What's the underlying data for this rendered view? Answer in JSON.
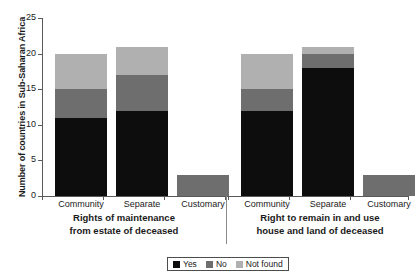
{
  "chart_data": {
    "type": "bar",
    "subtype": "stacked-bar-grouped",
    "title": "",
    "xlabel": "",
    "ylabel": "Number of countries in Sub-Saharan Africa",
    "ylim": [
      0,
      25
    ],
    "yticks": [
      0,
      5,
      10,
      15,
      20,
      25
    ],
    "ytick_labels": [
      "0",
      "5",
      "10",
      "15",
      "20",
      "25"
    ],
    "grid": false,
    "legend_position": "bottom-center",
    "categories": [
      "Community",
      "Separate",
      "Customary",
      "Community",
      "Separate",
      "Customary"
    ],
    "groups": [
      {
        "label_line1": "Rights of maintenance",
        "label_line2": "from estate of deceased",
        "categories": [
          "Community",
          "Separate",
          "Customary"
        ]
      },
      {
        "label_line1": "Right to remain in and use",
        "label_line2": "house and land of deceased",
        "categories": [
          "Community",
          "Separate",
          "Customary"
        ]
      }
    ],
    "series": [
      {
        "name": "Yes",
        "color": "#0d0d0d",
        "values": [
          11,
          12,
          0,
          12,
          18,
          0
        ]
      },
      {
        "name": "No",
        "color": "#6e6e6e",
        "values": [
          4,
          5,
          3,
          3,
          2,
          3
        ]
      },
      {
        "name": "Not found",
        "color": "#b0b0b0",
        "values": [
          5,
          4,
          0,
          5,
          1,
          0
        ]
      }
    ],
    "totals": [
      20,
      21,
      3,
      20,
      21,
      3
    ]
  },
  "legend": {
    "items": [
      {
        "label": "Yes",
        "color": "#0d0d0d"
      },
      {
        "label": "No",
        "color": "#6e6e6e"
      },
      {
        "label": "Not found",
        "color": "#b0b0b0"
      }
    ]
  },
  "axis": {
    "y_title": "Number of countries in Sub-Saharan Africa",
    "tick_0": "0",
    "tick_5": "5",
    "tick_10": "10",
    "tick_15": "15",
    "tick_20": "20",
    "tick_25": "25"
  },
  "categories": {
    "c0": "Community",
    "c1": "Separate",
    "c2": "Customary",
    "c3": "Community",
    "c4": "Separate",
    "c5": "Customary"
  },
  "group_titles": {
    "g1_line1": "Rights of maintenance",
    "g1_line2": "from estate of deceased",
    "g2_line1": "Right to remain in and use",
    "g2_line2": "house and land of deceased"
  },
  "colors": {
    "yes": "#0d0d0d",
    "no": "#6e6e6e",
    "not_found": "#b0b0b0",
    "axis": "#5a5a5a",
    "text": "#1a1a1a",
    "background": "#ffffff"
  }
}
